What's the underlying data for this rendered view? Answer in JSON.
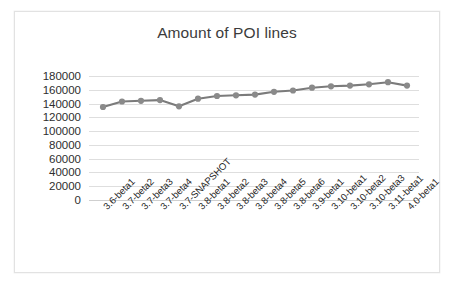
{
  "chart_data": {
    "type": "line",
    "title": "Amount of POI lines",
    "xlabel": "",
    "ylabel": "",
    "ylim": [
      0,
      180000
    ],
    "ytick_step": 20000,
    "yticks": [
      "180000",
      "160000",
      "140000",
      "120000",
      "100000",
      "80000",
      "60000",
      "40000",
      "20000",
      "0"
    ],
    "ytick_values": [
      180000,
      160000,
      140000,
      120000,
      100000,
      80000,
      60000,
      40000,
      20000,
      0
    ],
    "grid": true,
    "legend": "none",
    "marker": "circle",
    "line_color": "#7b7b7b",
    "marker_color": "#8a8a8a",
    "categories": [
      "3.6-beta1",
      "3.7-beta2",
      "3.7-beta3",
      "3.7-beta4",
      "3.7-SNAPSHOT",
      "3.8-beta1",
      "3.8-beta2",
      "3.8-beta3",
      "3.8-beta4",
      "3.8-beta5",
      "3.8-beta6",
      "3.9-beta1",
      "3.10-beta1",
      "3.10-beta2",
      "3.10-beta3",
      "3.11-beta1",
      "4.0-beta1"
    ],
    "values": [
      135000,
      143000,
      144000,
      145000,
      136000,
      147000,
      151000,
      152000,
      153000,
      157000,
      159000,
      163000,
      165000,
      166000,
      168000,
      171000,
      166000
    ],
    "series": [
      {
        "name": "Amount of POI lines",
        "values": [
          135000,
          143000,
          144000,
          145000,
          136000,
          147000,
          151000,
          152000,
          153000,
          157000,
          159000,
          163000,
          165000,
          166000,
          168000,
          171000,
          166000
        ]
      }
    ]
  },
  "colors": {
    "line": "#7b7b7b",
    "marker": "#8a8a8a",
    "grid": "#dedede",
    "text": "#2e2e2e",
    "border": "#e2e2e2",
    "background": "#ffffff"
  }
}
